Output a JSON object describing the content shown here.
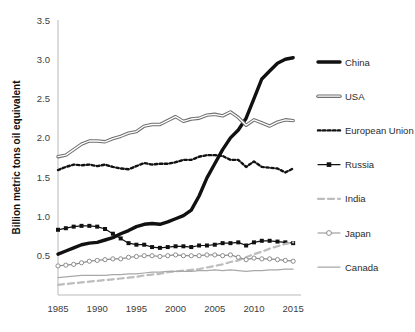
{
  "chart_data": {
    "type": "line",
    "title": "",
    "xlabel": "",
    "ylabel": "Billion metric tons oil equivalent",
    "xlim": [
      1985,
      2016
    ],
    "ylim": [
      0,
      3.5
    ],
    "xticks": [
      "1985",
      "1990",
      "1995",
      "2000",
      "2005",
      "2010",
      "2015"
    ],
    "xtick_values": [
      1985,
      1990,
      1995,
      2000,
      2005,
      2010,
      2015
    ],
    "yticks": [
      "0.5",
      "1.0",
      "1.5",
      "2.0",
      "2.5",
      "3.0",
      "3.5"
    ],
    "ytick_values": [
      0.5,
      1.0,
      1.5,
      2.0,
      2.5,
      3.0,
      3.5
    ],
    "grid": false,
    "legend_position": "right",
    "x": [
      1985,
      1986,
      1987,
      1988,
      1989,
      1990,
      1991,
      1992,
      1993,
      1994,
      1995,
      1996,
      1997,
      1998,
      1999,
      2000,
      2001,
      2002,
      2003,
      2004,
      2005,
      2006,
      2007,
      2008,
      2009,
      2010,
      2011,
      2012,
      2013,
      2014,
      2015
    ],
    "series": [
      {
        "name": "China",
        "color": "#111111",
        "style": "solid-thick",
        "marker": "none",
        "values": [
          0.52,
          0.56,
          0.6,
          0.64,
          0.66,
          0.67,
          0.7,
          0.73,
          0.78,
          0.82,
          0.87,
          0.9,
          0.91,
          0.9,
          0.93,
          0.97,
          1.01,
          1.08,
          1.26,
          1.49,
          1.67,
          1.85,
          2.0,
          2.1,
          2.25,
          2.5,
          2.75,
          2.85,
          2.95,
          3.0,
          3.02
        ]
      },
      {
        "name": "USA",
        "color": "#8d8d8d",
        "style": "solid-outlined",
        "marker": "none",
        "values": [
          1.76,
          1.78,
          1.85,
          1.92,
          1.96,
          1.96,
          1.95,
          1.99,
          2.02,
          2.06,
          2.08,
          2.15,
          2.17,
          2.17,
          2.22,
          2.27,
          2.21,
          2.24,
          2.25,
          2.29,
          2.3,
          2.28,
          2.33,
          2.26,
          2.16,
          2.23,
          2.19,
          2.15,
          2.2,
          2.23,
          2.22
        ]
      },
      {
        "name": "European Union",
        "color": "#111111",
        "style": "dotted",
        "marker": "none",
        "values": [
          1.59,
          1.63,
          1.66,
          1.65,
          1.66,
          1.64,
          1.66,
          1.63,
          1.61,
          1.6,
          1.64,
          1.68,
          1.66,
          1.67,
          1.67,
          1.69,
          1.72,
          1.72,
          1.76,
          1.78,
          1.78,
          1.77,
          1.72,
          1.72,
          1.63,
          1.7,
          1.63,
          1.62,
          1.61,
          1.56,
          1.61
        ]
      },
      {
        "name": "Russia",
        "color": "#111111",
        "style": "solid-thin",
        "marker": "square",
        "values": [
          0.83,
          0.85,
          0.87,
          0.88,
          0.88,
          0.87,
          0.84,
          0.78,
          0.72,
          0.66,
          0.64,
          0.64,
          0.61,
          0.6,
          0.61,
          0.62,
          0.62,
          0.61,
          0.63,
          0.63,
          0.64,
          0.66,
          0.66,
          0.67,
          0.63,
          0.67,
          0.69,
          0.69,
          0.68,
          0.67,
          0.66
        ]
      },
      {
        "name": "India",
        "color": "#bdbdbd",
        "style": "dashed",
        "marker": "none",
        "values": [
          0.13,
          0.14,
          0.15,
          0.16,
          0.17,
          0.18,
          0.19,
          0.2,
          0.21,
          0.22,
          0.23,
          0.25,
          0.26,
          0.27,
          0.29,
          0.3,
          0.31,
          0.32,
          0.33,
          0.35,
          0.37,
          0.39,
          0.42,
          0.44,
          0.48,
          0.52,
          0.55,
          0.59,
          0.62,
          0.65,
          0.67
        ]
      },
      {
        "name": "Japan",
        "color": "#8d8d8d",
        "style": "solid-thin",
        "marker": "circle",
        "values": [
          0.37,
          0.38,
          0.39,
          0.41,
          0.43,
          0.44,
          0.45,
          0.46,
          0.46,
          0.48,
          0.49,
          0.5,
          0.5,
          0.49,
          0.5,
          0.51,
          0.5,
          0.5,
          0.5,
          0.51,
          0.51,
          0.5,
          0.51,
          0.48,
          0.45,
          0.47,
          0.46,
          0.46,
          0.45,
          0.44,
          0.43
        ]
      },
      {
        "name": "Canada",
        "color": "#a8a8a8",
        "style": "solid-thin",
        "marker": "none",
        "values": [
          0.22,
          0.23,
          0.24,
          0.25,
          0.25,
          0.25,
          0.25,
          0.26,
          0.26,
          0.27,
          0.27,
          0.28,
          0.29,
          0.29,
          0.3,
          0.3,
          0.3,
          0.3,
          0.31,
          0.31,
          0.32,
          0.31,
          0.32,
          0.31,
          0.3,
          0.31,
          0.31,
          0.32,
          0.32,
          0.33,
          0.33
        ]
      }
    ]
  },
  "legend": {
    "items": [
      {
        "label": "China"
      },
      {
        "label": "USA"
      },
      {
        "label": "European Union"
      },
      {
        "label": "Russia"
      },
      {
        "label": "India"
      },
      {
        "label": "Japan"
      },
      {
        "label": "Canada"
      }
    ]
  }
}
